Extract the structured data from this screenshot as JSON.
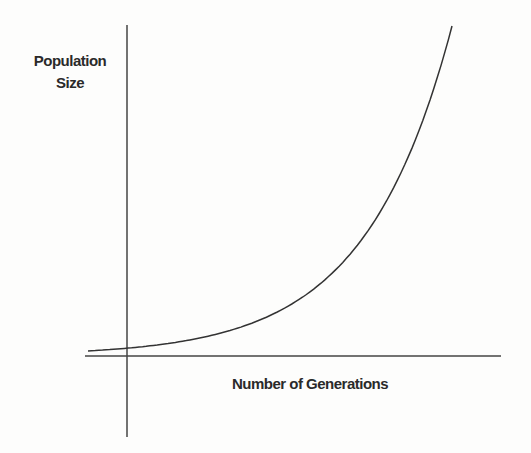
{
  "chart_data": {
    "type": "line",
    "title": "",
    "xlabel": "Number of Generations",
    "ylabel": "Population Size",
    "ylabel_lines": [
      "Population",
      "Size"
    ],
    "grid": false,
    "legend": null,
    "ticks": false,
    "series": [
      {
        "name": "Exponential growth",
        "shape": "exponential (J-curve)",
        "x": [
          0,
          1,
          2,
          3,
          4,
          5,
          6,
          7,
          8,
          9
        ],
        "values": [
          1,
          1.4,
          2,
          2.8,
          4,
          5.6,
          8,
          11,
          16,
          23
        ]
      }
    ],
    "colors": {
      "line": "#333333",
      "axis": "#444444",
      "background": "#fdfdfc"
    }
  }
}
